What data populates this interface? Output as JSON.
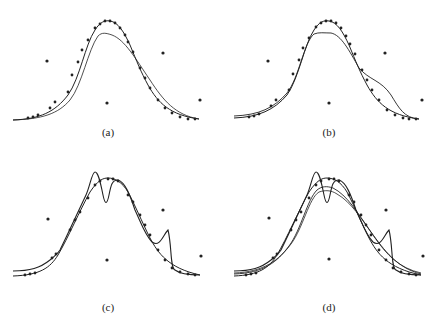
{
  "figure": {
    "panels": [
      {
        "label": "(a)",
        "curves": 2,
        "description": "Fitted curve vs smooth approximation"
      },
      {
        "label": "(b)",
        "curves": 2,
        "description": "Fitted curve with shoulder on right side"
      },
      {
        "label": "(c)",
        "curves": 2,
        "description": "Fitted curve with oscillations (dip near peak, bump on right)"
      },
      {
        "label": "(d)",
        "curves": 4,
        "description": "Overlay of multiple fitted curves"
      }
    ],
    "control_points": [
      {
        "name": "left",
        "x": 47,
        "y": 61
      },
      {
        "name": "center-bottom",
        "x": 107,
        "y": 103
      },
      {
        "name": "right-upper",
        "x": 163,
        "y": 53
      },
      {
        "name": "right-lower",
        "x": 200,
        "y": 100
      }
    ],
    "colors": {
      "ink": "#222222",
      "background": "#ffffff"
    }
  }
}
